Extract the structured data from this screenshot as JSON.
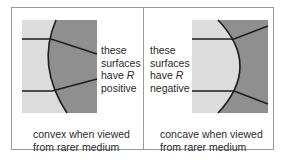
{
  "figure": {
    "panels": [
      {
        "id": "convex",
        "label_lines": [
          "these",
          "surfaces",
          "have",
          "R",
          "positive"
        ],
        "label": {
          "line1": "these",
          "line2": "surfaces",
          "line3_prefix": "have ",
          "line3_symbol": "R",
          "line4": "positive"
        },
        "caption": {
          "line1": "convex when viewed",
          "line2": "from rarer medium"
        }
      },
      {
        "id": "concave",
        "label": {
          "line1": "these",
          "line2": "surfaces",
          "line3_prefix": "have ",
          "line3_symbol": "R",
          "line4": "negative"
        },
        "caption": {
          "line1": "concave when viewed",
          "line2": "from rarer medium"
        }
      }
    ],
    "colors": {
      "rarer_medium": "#dcdcdc",
      "denser_medium": "#8f8f8f",
      "ray": "#1e1e1e",
      "frame": "#9a9a9a",
      "text": "#2a2a2a"
    }
  }
}
